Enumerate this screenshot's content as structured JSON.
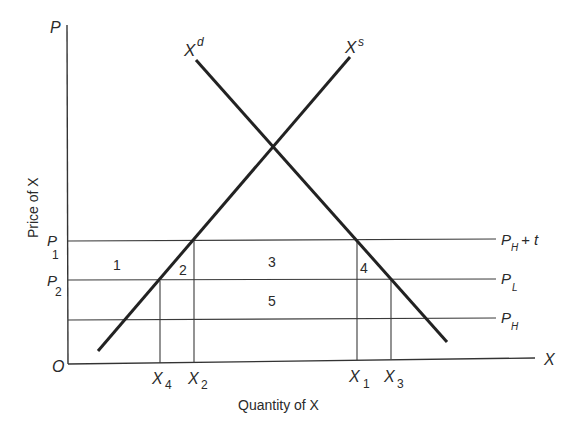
{
  "figure": {
    "type": "supply-demand diagram with tariff/price bands",
    "axes": {
      "y_axis_letter": "P",
      "x_axis_letter": "X",
      "origin": "O",
      "y_label": "Price of X",
      "x_label": "Quantity of X"
    },
    "curves": {
      "demand": {
        "label_base": "X",
        "label_sup": "d"
      },
      "supply": {
        "label_base": "X",
        "label_sup": "s"
      }
    },
    "price_lines": {
      "top": {
        "left_base": "P",
        "left_sub": "1",
        "right_base": "P",
        "right_sub": "H",
        "right_suffix": "+ t"
      },
      "middle": {
        "left_base": "P",
        "left_sub": "2",
        "right_base": "P",
        "right_sub": "L"
      },
      "bottom": {
        "right_base": "P",
        "right_sub": "H"
      }
    },
    "quantities": [
      {
        "base": "X",
        "sub": "4"
      },
      {
        "base": "X",
        "sub": "2"
      },
      {
        "base": "X",
        "sub": "1"
      },
      {
        "base": "X",
        "sub": "3"
      }
    ],
    "areas": [
      "1",
      "2",
      "3",
      "4",
      "5"
    ]
  },
  "colors": {
    "ink": "#2a2a2a",
    "thin_line": "#3a3a3a",
    "background": "#ffffff"
  }
}
